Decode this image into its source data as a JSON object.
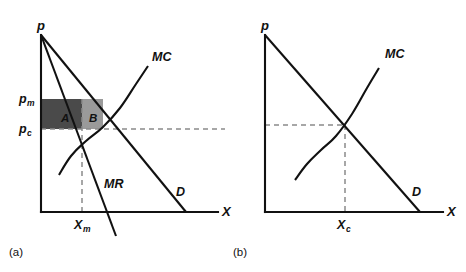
{
  "figure": {
    "width": 466,
    "height": 272,
    "background": "#ffffff",
    "stroke_color": "#111111",
    "dash_color": "#8a8a8a"
  },
  "chart_data": {
    "type": "line",
    "title": "",
    "subtitle": "",
    "xlabel": "X",
    "ylabel": "p",
    "grid": false,
    "legend": "inline-curve-labels",
    "panels": [
      {
        "id": "a",
        "caption": "(a)",
        "axis": {
          "x_label": "X",
          "y_label": "p",
          "origin": [
            41,
            212
          ],
          "x_end": [
            218,
            212
          ],
          "y_top": [
            41,
            35
          ]
        },
        "curves": [
          {
            "name": "D",
            "label": "D",
            "label_pos": [
              176,
              196
            ],
            "type": "line",
            "points": [
              [
                41,
                35
              ],
              [
                186,
                212
              ]
            ]
          },
          {
            "name": "MR",
            "label": "MR",
            "label_pos": [
              104,
              188
            ],
            "type": "line",
            "points": [
              [
                41,
                35
              ],
              [
                116,
                236
              ]
            ]
          },
          {
            "name": "MC",
            "label": "MC",
            "label_pos": [
              152,
              61
            ],
            "type": "curve",
            "points": [
              [
                59,
                175
              ],
              [
                71,
                156
              ],
              [
                86,
                141
              ],
              [
                103,
                127
              ],
              [
                120,
                108
              ],
              [
                136,
                84
              ],
              [
                148,
                66
              ]
            ]
          }
        ],
        "markers": {
          "p_m": {
            "label": "p",
            "sub": "m",
            "value_y": 99,
            "label_pos": [
              19,
              103
            ]
          },
          "p_c": {
            "label": "p",
            "sub": "c",
            "value_y": 129,
            "label_pos": [
              19,
              133
            ]
          },
          "X_m": {
            "label": "X",
            "sub": "m",
            "value_x": 82,
            "label_pos": [
              76,
              228
            ]
          },
          "monopoly_point": [
            82,
            99
          ],
          "competitive_point": [
            120,
            129
          ]
        },
        "dashed_lines": [
          {
            "name": "pc-horizontal",
            "from": [
              41,
              129
            ],
            "to": [
              225,
              129
            ]
          },
          {
            "name": "Xm-vertical",
            "from": [
              82,
              99
            ],
            "to": [
              82,
              212
            ]
          }
        ],
        "shaded_regions": [
          {
            "name": "A",
            "label": "A",
            "label_pos": [
              64,
              122
            ],
            "x": 41,
            "y": 99,
            "width": 41,
            "height": 30,
            "fill": "#4a4a4a"
          },
          {
            "name": "B",
            "label": "B",
            "label_pos": [
              96,
              122
            ],
            "x": 82,
            "y": 99,
            "width": 21,
            "height": 30,
            "fill": "#9a9a9a"
          }
        ]
      },
      {
        "id": "b",
        "caption": "(b)",
        "axis": {
          "x_label": "X",
          "y_label": "p",
          "origin": [
            265,
            212
          ],
          "x_end": [
            443,
            212
          ],
          "y_top": [
            265,
            35
          ]
        },
        "curves": [
          {
            "name": "D",
            "label": "D",
            "label_pos": [
              412,
              196
            ],
            "type": "line",
            "points": [
              [
                265,
                35
              ],
              [
                420,
                212
              ]
            ]
          },
          {
            "name": "MC",
            "label": "MC",
            "label_pos": [
              385,
              58
            ],
            "type": "curve",
            "points": [
              [
                295,
                180
              ],
              [
                307,
                164
              ],
              [
                321,
                150
              ],
              [
                336,
                136
              ],
              [
                352,
                114
              ],
              [
                367,
                88
              ],
              [
                379,
                68
              ]
            ]
          }
        ],
        "markers": {
          "X_c": {
            "label": "X",
            "sub": "c",
            "value_x": 345,
            "label_pos": [
              339,
              228
            ]
          },
          "competitive_point": [
            345,
            125
          ]
        },
        "dashed_lines": [
          {
            "name": "pc-horizontal",
            "from": [
              265,
              125
            ],
            "to": [
              345,
              125
            ]
          },
          {
            "name": "Xc-vertical",
            "from": [
              345,
              125
            ],
            "to": [
              345,
              212
            ]
          }
        ],
        "shaded_regions": []
      }
    ]
  }
}
